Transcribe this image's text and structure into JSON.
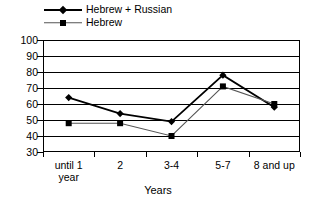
{
  "chart_data": {
    "type": "line",
    "title": "",
    "xlabel": "Years",
    "ylabel": "",
    "categories": [
      "until 1\nyear",
      "2",
      "3-4",
      "5-7",
      "8 and up"
    ],
    "yticks": [
      100,
      90,
      80,
      70,
      60,
      50,
      40,
      30
    ],
    "ylim": [
      30,
      100
    ],
    "grid": true,
    "legend_position": "top-left",
    "series": [
      {
        "name": "Hebrew + Russian",
        "marker": "diamond",
        "color": "#000000",
        "values": [
          64,
          54,
          49,
          78,
          58
        ]
      },
      {
        "name": "Hebrew",
        "marker": "square",
        "color": "#555555",
        "values": [
          48,
          48,
          40,
          71,
          60
        ]
      }
    ]
  },
  "legend": {
    "items": [
      {
        "label": "Hebrew + Russian",
        "marker": "diamond-marker-icon"
      },
      {
        "label": "Hebrew",
        "marker": "square-marker-icon"
      }
    ]
  },
  "axis": {
    "x_title": "Years"
  }
}
